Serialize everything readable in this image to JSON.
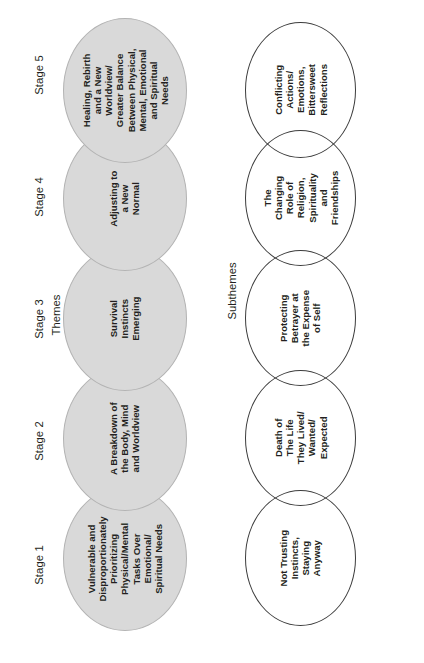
{
  "figure": {
    "orientation": "rotated-90-ccw",
    "sections": {
      "themes_label": "Themes",
      "subthemes_label": "Subthemes"
    },
    "colors": {
      "theme_fill": "#d9d9d9",
      "theme_stroke": "#b3b3b3",
      "subtheme_stroke": "#3c3c3c",
      "text": "#231f20",
      "background": "#ffffff"
    }
  },
  "stages": [
    {
      "label": "Stage 1"
    },
    {
      "label": "Stage 2"
    },
    {
      "label": "Stage 3"
    },
    {
      "label": "Stage 4"
    },
    {
      "label": "Stage 5"
    }
  ],
  "themes": [
    {
      "stage": "Stage 1",
      "text": "Vulnerable and\nDisproportionately\nPrioritizing\nPhysical/Mental\nTasks Over\nEmotional/\nSpiritual Needs"
    },
    {
      "stage": "Stage 2",
      "text": "A Breakdown of\nthe Body, Mind\nand Worldview"
    },
    {
      "stage": "Stage 3",
      "text": "Survival\nInstincts\nEmerging"
    },
    {
      "stage": "Stage 4",
      "text": "Adjusting to\na New\nNormal"
    },
    {
      "stage": "Stage 5",
      "text": "Healing, Rebirth\nand a New\nWorldview/\nGreater Balance\nBetween Physical,\nMental, Emotional\nand Spiritual\nNeeds"
    }
  ],
  "subthemes": [
    {
      "stage": "Stage 1",
      "text": "Not Trusting\nInstincts,\nStaying\nAnyway"
    },
    {
      "stage": "Stage 2",
      "text": "Death of\nThe Life\nThey Lived/\nWanted/\nExpected"
    },
    {
      "stage": "Stage 3",
      "text": "Protecting\nBetrayer at\nthe Expense\nof Self"
    },
    {
      "stage": "Stage 4",
      "text": "The\nChanging\nRole of\nReligion,\nSpirituality\nand\nFriendships"
    },
    {
      "stage": "Stage 5",
      "text": "Conflicting\nActions/\nEmotions,\nBittersweet\nReflections"
    }
  ]
}
